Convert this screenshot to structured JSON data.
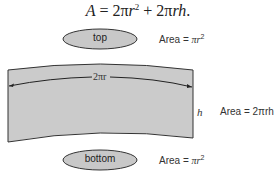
{
  "formula": {
    "lhs": "A",
    "eq": " = 2π",
    "r1": "r",
    "exp": "2",
    "plus": " + 2π",
    "rh": "rh",
    "end": "."
  },
  "top_disk": {
    "label": "top",
    "area_label": "Area = ",
    "area_pi": "π",
    "area_r": "r",
    "area_exp": "2"
  },
  "side": {
    "circumference_label": "2πr",
    "height_label": "h",
    "area_label": "Area = ",
    "area_value": "2πrh"
  },
  "bottom_disk": {
    "label": "bottom",
    "area_label": "Area = ",
    "area_pi": "π",
    "area_r": "r",
    "area_exp": "2"
  },
  "colors": {
    "fill": "#c8c8c8",
    "stroke": "#333333",
    "text": "#222222"
  }
}
